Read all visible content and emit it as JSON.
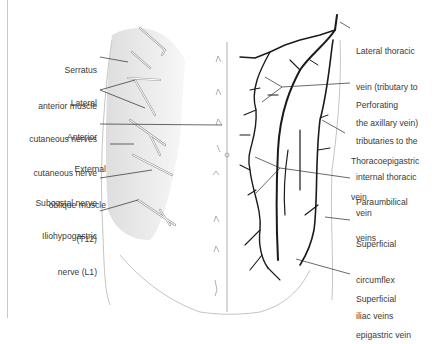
{
  "labels_left": [
    {
      "id": "serratus",
      "lines": [
        "Serratus",
        "anterior muscle"
      ]
    },
    {
      "id": "lateral-cutaneous",
      "lines": [
        "Lateral",
        "cutaneous nerves"
      ]
    },
    {
      "id": "anterior-cutaneous",
      "lines": [
        "Anterior",
        "cutaneous nerve"
      ]
    },
    {
      "id": "external-oblique",
      "lines": [
        "External",
        "oblique muscle"
      ]
    },
    {
      "id": "subcostal",
      "lines": [
        "Subcostal nerve",
        "(T12)"
      ]
    },
    {
      "id": "iliohypogastric",
      "lines": [
        "Iliohypogastric",
        "nerve (L1)"
      ]
    }
  ],
  "labels_right": [
    {
      "id": "lateral-thoracic",
      "lines": [
        "Lateral thoracic",
        "vein (tributary to",
        "the axillary vein)"
      ]
    },
    {
      "id": "perforating",
      "lines": [
        "Perforating",
        "tributaries to the",
        "internal thoracic",
        "vein"
      ]
    },
    {
      "id": "thoracoepigastric",
      "lines": [
        "Thoracoepigastric",
        "vein"
      ]
    },
    {
      "id": "paraumbilical",
      "lines": [
        "Paraumbilical",
        "veins"
      ]
    },
    {
      "id": "circumflex-iliac",
      "lines": [
        "Superficial",
        "circumflex",
        "iliac veins"
      ]
    },
    {
      "id": "superficial-epigastric",
      "lines": [
        "Superficial",
        "epigastric vein"
      ]
    }
  ],
  "colors": {
    "text": "#3a3a3a",
    "vein": "#1a1a1a",
    "nerve_outline": "#9a9a9a",
    "muscle_shade": "#d0d0d0",
    "leader": "#2a2a2a"
  }
}
